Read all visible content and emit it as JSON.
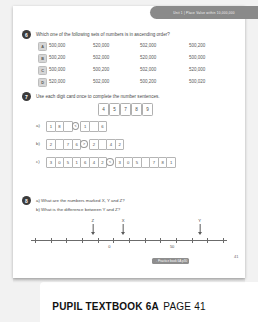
{
  "banner": {
    "text": "Unit 1 | Place Value within 10,000,000"
  },
  "q6": {
    "number": "6",
    "prompt": "Which one of the following sets of numbers is in ascending order?",
    "options": [
      {
        "letter": "A",
        "values": [
          "500,000",
          "520,000",
          "502,000",
          "500,200"
        ]
      },
      {
        "letter": "B",
        "values": [
          "500,200",
          "502,000",
          "520,000",
          "500,000"
        ]
      },
      {
        "letter": "C",
        "values": [
          "500,000",
          "500,200",
          "502,000",
          "520,000"
        ]
      },
      {
        "letter": "D",
        "values": [
          "520,000",
          "502,000",
          "500,200",
          "500,020"
        ]
      }
    ]
  },
  "q7": {
    "number": "7",
    "prompt": "Use each digit card once to complete the number sentences.",
    "cards": [
      "4",
      "5",
      "7",
      "8",
      "9"
    ],
    "lines": [
      {
        "label": "a)",
        "cells": [
          {
            "type": "box",
            "value": "1"
          },
          {
            "type": "box",
            "value": "8"
          },
          {
            "type": "box",
            "value": ""
          },
          {
            "type": "op",
            "value": "<"
          },
          {
            "type": "box",
            "value": "1"
          },
          {
            "type": "box",
            "value": ""
          },
          {
            "type": "box",
            "value": "6"
          }
        ]
      },
      {
        "label": "b)",
        "cells": [
          {
            "type": "box",
            "value": "2"
          },
          {
            "type": "box",
            "value": ""
          },
          {
            "type": "box",
            "value": "7"
          },
          {
            "type": "box",
            "value": "6"
          },
          {
            "type": "op",
            "value": ">"
          },
          {
            "type": "box",
            "value": "2"
          },
          {
            "type": "box",
            "value": ""
          },
          {
            "type": "box",
            "value": "4"
          },
          {
            "type": "box",
            "value": "2"
          }
        ]
      },
      {
        "label": "c)",
        "cells": [
          {
            "type": "box",
            "value": "3"
          },
          {
            "type": "box",
            "value": "0"
          },
          {
            "type": "box",
            "value": "5"
          },
          {
            "type": "box",
            "value": "1"
          },
          {
            "type": "box",
            "value": "6"
          },
          {
            "type": "box",
            "value": "4"
          },
          {
            "type": "box",
            "value": "2"
          },
          {
            "type": "op",
            "value": "<"
          },
          {
            "type": "box",
            "value": "3"
          },
          {
            "type": "box",
            "value": "0"
          },
          {
            "type": "box",
            "value": "5"
          },
          {
            "type": "box",
            "value": ""
          },
          {
            "type": "box",
            "value": "7"
          },
          {
            "type": "box",
            "value": "8"
          },
          {
            "type": "box",
            "value": "1"
          }
        ]
      }
    ]
  },
  "q8": {
    "number": "8",
    "part_a": "a) What are the numbers marked X, Y and Z?",
    "part_b": "b) What is the difference between Y and Z?",
    "number_line": {
      "tick_labels": [
        {
          "text": "0",
          "pos": 0.4
        },
        {
          "text": "50",
          "pos": 0.72
        }
      ],
      "markers": [
        {
          "label": "Z",
          "pos": 0.315
        },
        {
          "label": "X",
          "pos": 0.47
        },
        {
          "label": "Y",
          "pos": 0.86
        }
      ],
      "tick_count": 13
    }
  },
  "footer": {
    "practice_pill": "→ Practice book 6A p30",
    "page_number": "41"
  },
  "caption": {
    "bold": "PUPIL TEXTBOOK 6A",
    "normal": "PAGE 41"
  }
}
